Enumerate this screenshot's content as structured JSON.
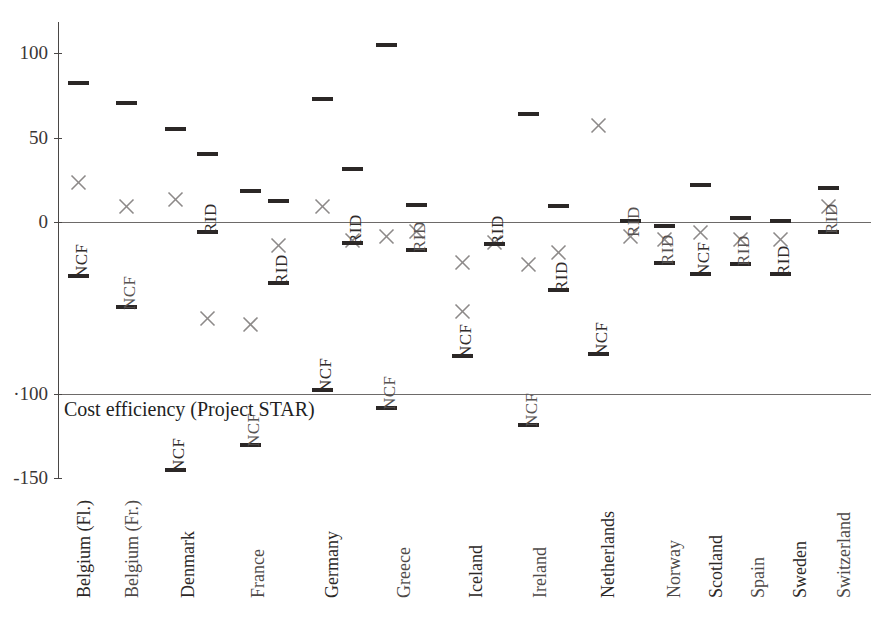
{
  "chart_data": {
    "type": "scatter",
    "title": "",
    "caption": "Cost efficiency (Project STAR)",
    "xlabel": "",
    "ylabel": "",
    "ylim": [
      -150,
      125
    ],
    "yticks": [
      100,
      50,
      0,
      -100,
      -150
    ],
    "ytick_labels": [
      "100",
      "50",
      "0",
      "·100",
      "-150"
    ],
    "grid": false,
    "legend": false,
    "reference_lines": [
      0,
      -100
    ],
    "series": [
      {
        "name": "estimate-dash",
        "marker": "dash",
        "color": "#2b2726"
      },
      {
        "name": "estimate-cross",
        "marker": "x",
        "color": "#8d8a89"
      }
    ],
    "categories": [
      "Belgium (Fl.)",
      "Belgium (Fr.)",
      "Denmark",
      "France",
      "Germany",
      "Greece",
      "Iceland",
      "Ireland",
      "Netherlands",
      "Norway",
      "Scotland",
      "Spain",
      "Sweden",
      "Switzerland"
    ],
    "points": [
      {
        "category": "Belgium (Fl.)",
        "dashes": [
          85,
          -32
        ],
        "crosses": [
          28
        ],
        "annotations": [
          {
            "text": "NCF",
            "value": -32
          }
        ]
      },
      {
        "category": "Belgium (Fr.)",
        "dashes": [
          74,
          -50
        ],
        "crosses": [
          12
        ],
        "annotations": [
          {
            "text": "NCF",
            "value": -50
          }
        ]
      },
      {
        "category": "Denmark",
        "dashes": [
          57,
          -130
        ],
        "crosses": [
          19,
          -45
        ],
        "annotations": [
          {
            "text": "NCF",
            "value": -130
          }
        ]
      },
      {
        "category": "Denmark-2",
        "dashes": [
          43,
          -5
        ],
        "crosses": [],
        "annotations": [
          {
            "text": "RID",
            "value": -5
          }
        ]
      },
      {
        "category": "France",
        "dashes": [
          21,
          -131
        ],
        "crosses": [
          -55
        ],
        "annotations": [
          {
            "text": "NCF",
            "value": -131
          }
        ]
      },
      {
        "category": "France-2",
        "dashes": [
          14,
          -35
        ],
        "crosses": [
          -9
        ],
        "annotations": [
          {
            "text": "RID",
            "value": -35
          }
        ]
      },
      {
        "category": "Germany",
        "dashes": [
          75,
          -98
        ],
        "crosses": [
          12
        ],
        "annotations": [
          {
            "text": "NCF",
            "value": -98
          }
        ]
      },
      {
        "category": "Germany-2",
        "dashes": [
          34,
          -12
        ],
        "crosses": [
          -7
        ],
        "annotations": [
          {
            "text": "RID",
            "value": -12
          }
        ]
      },
      {
        "category": "Greece",
        "dashes": [
          106,
          -110
        ],
        "crosses": [
          -4
        ],
        "annotations": [
          {
            "text": "NCF",
            "value": -110
          }
        ]
      },
      {
        "category": "Greece-2",
        "dashes": [
          11,
          -16
        ],
        "crosses": [
          -1
        ],
        "annotations": [
          {
            "text": "RID",
            "value": -16
          }
        ]
      },
      {
        "category": "Iceland",
        "dashes": [
          -77
        ],
        "crosses": [
          -20,
          -49
        ],
        "annotations": [
          {
            "text": "NCF",
            "value": -77
          }
        ]
      },
      {
        "category": "Iceland-2",
        "dashes": [
          -12
        ],
        "crosses": [
          -8
        ],
        "annotations": [
          {
            "text": "RID",
            "value": -12
          }
        ]
      },
      {
        "category": "Ireland",
        "dashes": [
          66,
          -107
        ],
        "crosses": [
          -21
        ],
        "annotations": [
          {
            "text": "NCF",
            "value": -107
          }
        ]
      },
      {
        "category": "Ireland-2",
        "dashes": [
          10,
          -38
        ],
        "crosses": [
          -14
        ],
        "annotations": [
          {
            "text": "RID",
            "value": -38
          }
        ]
      },
      {
        "category": "Netherlands",
        "dashes": [
          -78
        ],
        "crosses": [
          61
        ],
        "annotations": [
          {
            "text": "NCF",
            "value": -78
          }
        ]
      },
      {
        "category": "Netherlands-2",
        "dashes": [
          1
        ],
        "crosses": [
          -2
        ],
        "annotations": [
          {
            "text": "RID",
            "value": 1
          }
        ]
      },
      {
        "category": "Norway",
        "dashes": [
          -2,
          -26
        ],
        "crosses": [
          -1
        ],
        "annotations": [
          {
            "text": "RID",
            "value": -26
          }
        ]
      },
      {
        "category": "Scotland",
        "dashes": [
          25,
          -30
        ],
        "crosses": [
          -2
        ],
        "annotations": [
          {
            "text": "NCF",
            "value": -30
          }
        ]
      },
      {
        "category": "Spain",
        "dashes": [
          3,
          -25
        ],
        "crosses": [
          -5
        ],
        "annotations": [
          {
            "text": "RID",
            "value": -25
          }
        ]
      },
      {
        "category": "Sweden",
        "dashes": [
          1,
          -30
        ],
        "crosses": [
          -13
        ],
        "annotations": [
          {
            "text": "RID",
            "value": -30
          }
        ]
      },
      {
        "category": "Switzerland",
        "dashes": [
          23,
          -5
        ],
        "crosses": [
          12
        ],
        "annotations": [
          {
            "text": "RID",
            "value": -5
          }
        ]
      }
    ]
  },
  "axis": {
    "ticks": [
      {
        "label": "100",
        "value": 100
      },
      {
        "label": "50",
        "value": 50
      },
      {
        "label": "0",
        "value": 0
      },
      {
        "label": "·100",
        "value": -100
      },
      {
        "label": "-150",
        "value": -150
      }
    ]
  },
  "caption": {
    "text": "Cost efficiency (Project STAR)"
  },
  "markers": [
    {
      "name": "marker-dash-belgium-fl-1",
      "kind": "dash",
      "x": 78,
      "y": 81,
      "tone": "dark"
    },
    {
      "name": "marker-cross-belgium-fl-1",
      "kind": "cross",
      "x": 78,
      "y": 174,
      "tone": "light"
    },
    {
      "name": "marker-dash-belgium-fl-2",
      "kind": "dash",
      "x": 78,
      "y": 274,
      "tone": "dark"
    },
    {
      "name": "label-ncf-belgium-fl",
      "kind": "vlabel",
      "x": 72,
      "y": 278,
      "text": "NCF",
      "tone": "dark"
    },
    {
      "name": "marker-dash-belgium-fr-1",
      "kind": "dash",
      "x": 126,
      "y": 101,
      "tone": "dark"
    },
    {
      "name": "marker-cross-belgium-fr-1",
      "kind": "cross",
      "x": 126,
      "y": 198,
      "tone": "light"
    },
    {
      "name": "marker-dash-belgium-fr-2",
      "kind": "dash",
      "x": 126,
      "y": 305,
      "tone": "dark"
    },
    {
      "name": "label-ncf-belgium-fr",
      "kind": "vlabel",
      "x": 120,
      "y": 310,
      "text": "NCF",
      "tone": "light"
    },
    {
      "name": "marker-dash-denmark-1",
      "kind": "dash",
      "x": 175,
      "y": 127,
      "tone": "dark"
    },
    {
      "name": "marker-cross-denmark-1",
      "kind": "cross",
      "x": 175,
      "y": 191,
      "tone": "light"
    },
    {
      "name": "marker-dash-denmark-2",
      "kind": "dash",
      "x": 175,
      "y": 468,
      "tone": "dark"
    },
    {
      "name": "label-ncf-denmark",
      "kind": "vlabel",
      "x": 169,
      "y": 472,
      "text": "NCF",
      "tone": "dark"
    },
    {
      "name": "marker-dash-denmark-rid-1",
      "kind": "dash",
      "x": 207,
      "y": 152,
      "tone": "dark"
    },
    {
      "name": "marker-cross-denmark-rid",
      "kind": "cross",
      "x": 207,
      "y": 310,
      "tone": "light"
    },
    {
      "name": "marker-dash-denmark-rid-2",
      "kind": "dash",
      "x": 207,
      "y": 230,
      "tone": "dark"
    },
    {
      "name": "label-rid-denmark",
      "kind": "vlabel",
      "x": 201,
      "y": 234,
      "text": "RID",
      "tone": "dark"
    },
    {
      "name": "marker-dash-france-1",
      "kind": "dash",
      "x": 250,
      "y": 189,
      "tone": "dark"
    },
    {
      "name": "marker-cross-france-1",
      "kind": "cross",
      "x": 250,
      "y": 316,
      "tone": "light"
    },
    {
      "name": "marker-dash-france-2",
      "kind": "dash",
      "x": 250,
      "y": 443,
      "tone": "dark"
    },
    {
      "name": "label-ncf-france",
      "kind": "vlabel",
      "x": 244,
      "y": 447,
      "text": "NCF",
      "tone": "light"
    },
    {
      "name": "marker-dash-france-rid-1",
      "kind": "dash",
      "x": 278,
      "y": 199,
      "tone": "dark"
    },
    {
      "name": "marker-cross-france-rid",
      "kind": "cross",
      "x": 278,
      "y": 237,
      "tone": "light"
    },
    {
      "name": "marker-dash-france-rid-2",
      "kind": "dash",
      "x": 278,
      "y": 281,
      "tone": "dark"
    },
    {
      "name": "label-rid-france",
      "kind": "vlabel",
      "x": 272,
      "y": 285,
      "text": "RID",
      "tone": "dark"
    },
    {
      "name": "marker-dash-germany-1",
      "kind": "dash",
      "x": 322,
      "y": 97,
      "tone": "dark"
    },
    {
      "name": "marker-cross-germany-1",
      "kind": "cross",
      "x": 322,
      "y": 198,
      "tone": "light"
    },
    {
      "name": "marker-dash-germany-2",
      "kind": "dash",
      "x": 322,
      "y": 388,
      "tone": "dark"
    },
    {
      "name": "label-ncf-germany",
      "kind": "vlabel",
      "x": 316,
      "y": 392,
      "text": "NCF",
      "tone": "dark"
    },
    {
      "name": "marker-dash-germany-rid-1",
      "kind": "dash",
      "x": 352,
      "y": 167,
      "tone": "dark"
    },
    {
      "name": "marker-cross-germany-rid",
      "kind": "cross",
      "x": 352,
      "y": 232,
      "tone": "light"
    },
    {
      "name": "marker-dash-germany-rid-2",
      "kind": "dash",
      "x": 352,
      "y": 241,
      "tone": "dark"
    },
    {
      "name": "label-rid-germany",
      "kind": "vlabel",
      "x": 346,
      "y": 245,
      "text": "RID",
      "tone": "dark"
    },
    {
      "name": "marker-dash-greece-1",
      "kind": "dash",
      "x": 386,
      "y": 43,
      "tone": "dark"
    },
    {
      "name": "marker-cross-greece-1",
      "kind": "cross",
      "x": 386,
      "y": 228,
      "tone": "light"
    },
    {
      "name": "marker-dash-greece-2",
      "kind": "dash",
      "x": 386,
      "y": 406,
      "tone": "dark"
    },
    {
      "name": "label-ncf-greece",
      "kind": "vlabel",
      "x": 380,
      "y": 410,
      "text": "NCF",
      "tone": "light"
    },
    {
      "name": "marker-dash-greece-rid-1",
      "kind": "dash",
      "x": 416,
      "y": 203,
      "tone": "dark"
    },
    {
      "name": "marker-cross-greece-rid",
      "kind": "cross",
      "x": 416,
      "y": 223,
      "tone": "light"
    },
    {
      "name": "marker-dash-greece-rid-2",
      "kind": "dash",
      "x": 416,
      "y": 248,
      "tone": "dark"
    },
    {
      "name": "label-rid-greece",
      "kind": "vlabel",
      "x": 410,
      "y": 252,
      "text": "RID",
      "tone": "light"
    },
    {
      "name": "marker-cross-iceland-1",
      "kind": "cross",
      "x": 462,
      "y": 254,
      "tone": "light"
    },
    {
      "name": "marker-cross-iceland-2",
      "kind": "cross",
      "x": 462,
      "y": 303,
      "tone": "light"
    },
    {
      "name": "marker-dash-iceland-1",
      "kind": "dash",
      "x": 462,
      "y": 354,
      "tone": "dark"
    },
    {
      "name": "label-ncf-iceland",
      "kind": "vlabel",
      "x": 456,
      "y": 358,
      "text": "NCF",
      "tone": "dark"
    },
    {
      "name": "marker-cross-iceland-rid",
      "kind": "cross",
      "x": 494,
      "y": 234,
      "tone": "light"
    },
    {
      "name": "marker-dash-iceland-rid",
      "kind": "dash",
      "x": 494,
      "y": 242,
      "tone": "dark"
    },
    {
      "name": "label-rid-iceland",
      "kind": "vlabel",
      "x": 488,
      "y": 246,
      "text": "RID",
      "tone": "dark"
    },
    {
      "name": "marker-dash-ireland-1",
      "kind": "dash",
      "x": 528,
      "y": 112,
      "tone": "dark"
    },
    {
      "name": "marker-cross-ireland-1",
      "kind": "cross",
      "x": 528,
      "y": 256,
      "tone": "light"
    },
    {
      "name": "marker-dash-ireland-2",
      "kind": "dash",
      "x": 528,
      "y": 423,
      "tone": "dark"
    },
    {
      "name": "label-ncf-ireland",
      "kind": "vlabel",
      "x": 522,
      "y": 427,
      "text": "NCF",
      "tone": "light"
    },
    {
      "name": "marker-dash-ireland-rid-1",
      "kind": "dash",
      "x": 558,
      "y": 204,
      "tone": "dark"
    },
    {
      "name": "marker-cross-ireland-rid",
      "kind": "cross",
      "x": 558,
      "y": 244,
      "tone": "light"
    },
    {
      "name": "marker-dash-ireland-rid-2",
      "kind": "dash",
      "x": 558,
      "y": 288,
      "tone": "dark"
    },
    {
      "name": "label-rid-ireland",
      "kind": "vlabel",
      "x": 552,
      "y": 292,
      "text": "RID",
      "tone": "dark"
    },
    {
      "name": "marker-cross-netherlands-1",
      "kind": "cross",
      "x": 598,
      "y": 117,
      "tone": "light"
    },
    {
      "name": "marker-dash-netherlands-1",
      "kind": "dash",
      "x": 598,
      "y": 352,
      "tone": "dark"
    },
    {
      "name": "label-ncf-netherlands",
      "kind": "vlabel",
      "x": 592,
      "y": 356,
      "text": "NCF",
      "tone": "dark"
    },
    {
      "name": "marker-dash-nl-rid-1",
      "kind": "dash",
      "x": 630,
      "y": 219,
      "tone": "dark"
    },
    {
      "name": "marker-cross-nl-rid",
      "kind": "cross",
      "x": 630,
      "y": 228,
      "tone": "light"
    },
    {
      "name": "label-rid-netherlands",
      "kind": "vlabel",
      "x": 624,
      "y": 237,
      "text": "RID",
      "tone": "light"
    },
    {
      "name": "marker-dash-norway-1",
      "kind": "dash",
      "x": 664,
      "y": 224,
      "tone": "dark"
    },
    {
      "name": "marker-cross-norway-1",
      "kind": "cross",
      "x": 664,
      "y": 231,
      "tone": "light"
    },
    {
      "name": "marker-dash-norway-2",
      "kind": "dash",
      "x": 664,
      "y": 261,
      "tone": "dark"
    },
    {
      "name": "label-rid-norway",
      "kind": "vlabel",
      "x": 658,
      "y": 265,
      "text": "RID",
      "tone": "light"
    },
    {
      "name": "marker-dash-scotland-1",
      "kind": "dash",
      "x": 700,
      "y": 183,
      "tone": "dark"
    },
    {
      "name": "marker-cross-scotland-1",
      "kind": "cross",
      "x": 700,
      "y": 224,
      "tone": "light"
    },
    {
      "name": "marker-dash-scotland-2",
      "kind": "dash",
      "x": 700,
      "y": 272,
      "tone": "dark"
    },
    {
      "name": "label-ncf-scotland",
      "kind": "vlabel",
      "x": 694,
      "y": 276,
      "text": "NCF",
      "tone": "dark"
    },
    {
      "name": "marker-dash-spain-1",
      "kind": "dash",
      "x": 740,
      "y": 216,
      "tone": "dark"
    },
    {
      "name": "marker-cross-spain-1",
      "kind": "cross",
      "x": 740,
      "y": 231,
      "tone": "light"
    },
    {
      "name": "marker-dash-spain-2",
      "kind": "dash",
      "x": 740,
      "y": 262,
      "tone": "dark"
    },
    {
      "name": "label-rid-spain",
      "kind": "vlabel",
      "x": 734,
      "y": 266,
      "text": "RID",
      "tone": "light"
    },
    {
      "name": "marker-dash-sweden-1",
      "kind": "dash",
      "x": 780,
      "y": 219,
      "tone": "dark"
    },
    {
      "name": "marker-cross-sweden-1",
      "kind": "cross",
      "x": 780,
      "y": 231,
      "tone": "light"
    },
    {
      "name": "marker-dash-sweden-2",
      "kind": "dash",
      "x": 780,
      "y": 272,
      "tone": "dark"
    },
    {
      "name": "label-rid-sweden",
      "kind": "vlabel",
      "x": 774,
      "y": 276,
      "text": "RID",
      "tone": "dark"
    },
    {
      "name": "marker-dash-switzerland-1",
      "kind": "dash",
      "x": 828,
      "y": 186,
      "tone": "dark"
    },
    {
      "name": "marker-cross-switzerland-1",
      "kind": "cross",
      "x": 828,
      "y": 198,
      "tone": "light"
    },
    {
      "name": "marker-dash-switzerland-2",
      "kind": "dash",
      "x": 828,
      "y": 230,
      "tone": "dark"
    },
    {
      "name": "label-rid-switzerland",
      "kind": "vlabel",
      "x": 822,
      "y": 234,
      "text": "RID",
      "tone": "light"
    }
  ],
  "country_labels": [
    {
      "name": "x-label-belgium-fl",
      "text": "Belgium (Fl.)",
      "x": 74,
      "y": 598,
      "tone": "dark"
    },
    {
      "name": "x-label-belgium-fr",
      "text": "Belgium (Fr.)",
      "x": 122,
      "y": 598,
      "tone": "light"
    },
    {
      "name": "x-label-denmark",
      "text": "Denmark",
      "x": 178,
      "y": 598,
      "tone": "dark"
    },
    {
      "name": "x-label-france",
      "text": "France",
      "x": 248,
      "y": 598,
      "tone": "light"
    },
    {
      "name": "x-label-germany",
      "text": "Germany",
      "x": 322,
      "y": 598,
      "tone": "dark"
    },
    {
      "name": "x-label-greece",
      "text": "Greece",
      "x": 394,
      "y": 598,
      "tone": "light"
    },
    {
      "name": "x-label-iceland",
      "text": "Iceland",
      "x": 466,
      "y": 598,
      "tone": "dark"
    },
    {
      "name": "x-label-ireland",
      "text": "Ireland",
      "x": 530,
      "y": 598,
      "tone": "light"
    },
    {
      "name": "x-label-netherlands",
      "text": "Netherlands",
      "x": 598,
      "y": 598,
      "tone": "dark"
    },
    {
      "name": "x-label-norway",
      "text": "Norway",
      "x": 664,
      "y": 598,
      "tone": "light"
    },
    {
      "name": "x-label-scotland",
      "text": "Scotland",
      "x": 706,
      "y": 598,
      "tone": "dark"
    },
    {
      "name": "x-label-spain",
      "text": "Spain",
      "x": 748,
      "y": 598,
      "tone": "light"
    },
    {
      "name": "x-label-sweden",
      "text": "Sweden",
      "x": 790,
      "y": 598,
      "tone": "dark"
    },
    {
      "name": "x-label-switzerland",
      "text": "Switzerland",
      "x": 834,
      "y": 598,
      "tone": "light"
    }
  ]
}
